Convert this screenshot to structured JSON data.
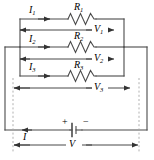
{
  "figure": {
    "line_color": "#444444",
    "dash_color": "#9a9a9a",
    "text_color": "#000000",
    "background": "#ffffff"
  },
  "branches": [
    {
      "current_label": "I",
      "current_sub": "1",
      "resistor_label": "R",
      "resistor_sub": "1",
      "voltage_label": "V",
      "voltage_sub": "1"
    },
    {
      "current_label": "I",
      "current_sub": "2",
      "resistor_label": "R",
      "resistor_sub": "2",
      "voltage_label": "V",
      "voltage_sub": "2"
    },
    {
      "current_label": "I",
      "current_sub": "3",
      "resistor_label": "R",
      "resistor_sub": "3",
      "voltage_label": "V",
      "voltage_sub": "3"
    }
  ],
  "source": {
    "plus_sign": "+",
    "minus_sign": "−",
    "total_current_label": "I",
    "total_voltage_label": "V"
  }
}
